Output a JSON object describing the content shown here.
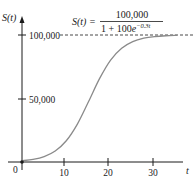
{
  "chart_data": {
    "type": "line",
    "title": "",
    "formula": {
      "lhs": "S(t) =",
      "numerator": "100,000",
      "denominator_prefix": "1 + 100",
      "denominator_e": "e",
      "exponent": "−0.3t"
    },
    "xlabel": "t",
    "ylabel": "S(t)",
    "xlim": [
      0,
      40
    ],
    "ylim": [
      0,
      100000
    ],
    "x_ticks": [
      0,
      10,
      20,
      30
    ],
    "x_tick_labels": [
      "0",
      "10",
      "20",
      "30"
    ],
    "y_ticks": [
      50000,
      100000
    ],
    "y_tick_labels": [
      "50,000",
      "100,000"
    ],
    "asymptote": {
      "y": 100000,
      "style": "dashed"
    },
    "grid": false,
    "legend": null,
    "series": [
      {
        "name": "S(t) = 100,000 / (1 + 100e^(-0.3t))",
        "color": "#8a8a8a",
        "x": [
          0,
          2.5,
          5,
          7.5,
          10,
          12.5,
          15,
          17.5,
          20,
          22.5,
          25,
          27.5,
          30,
          32.5,
          35
        ],
        "values": [
          990,
          2070,
          4290,
          8660,
          16720,
          29820,
          47390,
          65650,
          80290,
          89600,
          94770,
          97470,
          98780,
          99420,
          99730
        ]
      }
    ]
  }
}
